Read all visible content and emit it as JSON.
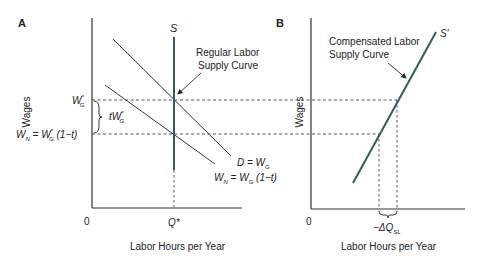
{
  "colors": {
    "supply_line": "#2f5e5c",
    "axis": "#333333",
    "demand_line": "#333333",
    "dashed": "#444444",
    "text": "#222222"
  },
  "panel_a": {
    "label": "A",
    "y_axis_label": "Wages",
    "x_axis_label": "Labor Hours per Year",
    "origin_label": "0",
    "supply_label": "S",
    "supply_annotation_line1": "Regular Labor",
    "supply_annotation_line2": "Supply Curve",
    "wage_gross_label": "W",
    "wage_gross_sub": "G",
    "wage_gross_sup": "*",
    "wage_net_label_prefix": "W",
    "wage_net_sub": "N",
    "wage_net_eq": " = W",
    "wage_net_eq_sub": "G",
    "wage_net_eq_sup": "*",
    "wage_net_eq_tail": " (1−t)",
    "tax_wedge_label": "tW",
    "tax_wedge_sub": "G",
    "tax_wedge_sup": "*",
    "demand_label": "D = W",
    "demand_sub": "G",
    "net_demand_label": "W",
    "net_demand_sub": "N",
    "net_demand_eq": " = W",
    "net_demand_eq_sub": "G",
    "net_demand_tail": " (1−t)",
    "quantity_label": "Q*"
  },
  "panel_b": {
    "label": "B",
    "y_axis_label": "Wages",
    "x_axis_label": "Labor Hours per Year",
    "origin_label": "0",
    "supply_label": "S′",
    "supply_annotation_line1": "Compensated Labor",
    "supply_annotation_line2": "Supply Curve",
    "delta_label": "−ΔQ",
    "delta_sub": "SL"
  }
}
